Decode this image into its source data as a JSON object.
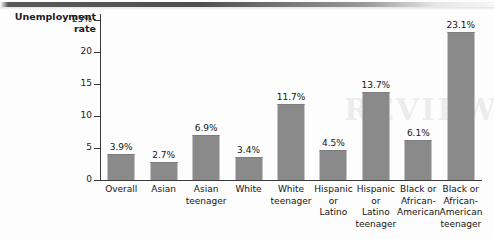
{
  "figure": {
    "axis_title_line1": "Unemployment",
    "axis_title_line2": "rate",
    "watermark_text": "REVIEW"
  },
  "chart_data": {
    "type": "bar",
    "title": "",
    "xlabel": "",
    "ylabel": "Unemployment rate",
    "ylim": [
      0,
      26
    ],
    "grid": false,
    "legend": false,
    "bar_color": "#8a8a8a",
    "axis_color": "#3a3a3a",
    "value_suffix": "%",
    "yticks": [
      {
        "value": 25,
        "label": "25%"
      },
      {
        "value": 20,
        "label": "20"
      },
      {
        "value": 15,
        "label": "15"
      },
      {
        "value": 10,
        "label": "10"
      },
      {
        "value": 5,
        "label": "5"
      },
      {
        "value": 0,
        "label": "0"
      }
    ],
    "categories": [
      "Overall",
      "Asian",
      "Asian teenager",
      "White",
      "White teenager",
      "Hispanic or Latino",
      "Hispanic or Latino teenager",
      "Black or African-American",
      "Black or African-American teenager"
    ],
    "category_lines": [
      [
        "Overall"
      ],
      [
        "Asian"
      ],
      [
        "Asian",
        "teenager"
      ],
      [
        "White"
      ],
      [
        "White",
        "teenager"
      ],
      [
        "Hispanic",
        "or",
        "Latino"
      ],
      [
        "Hispanic",
        "or",
        "Latino",
        "teenager"
      ],
      [
        "Black or",
        "African-",
        "American"
      ],
      [
        "Black or",
        "African-",
        "American",
        "teenager"
      ]
    ],
    "values": [
      3.9,
      2.7,
      6.9,
      3.4,
      11.7,
      4.5,
      13.7,
      6.1,
      23.1
    ],
    "value_labels": [
      "3.9%",
      "2.7%",
      "6.9%",
      "3.4%",
      "11.7%",
      "4.5%",
      "13.7%",
      "6.1%",
      "23.1%"
    ]
  }
}
